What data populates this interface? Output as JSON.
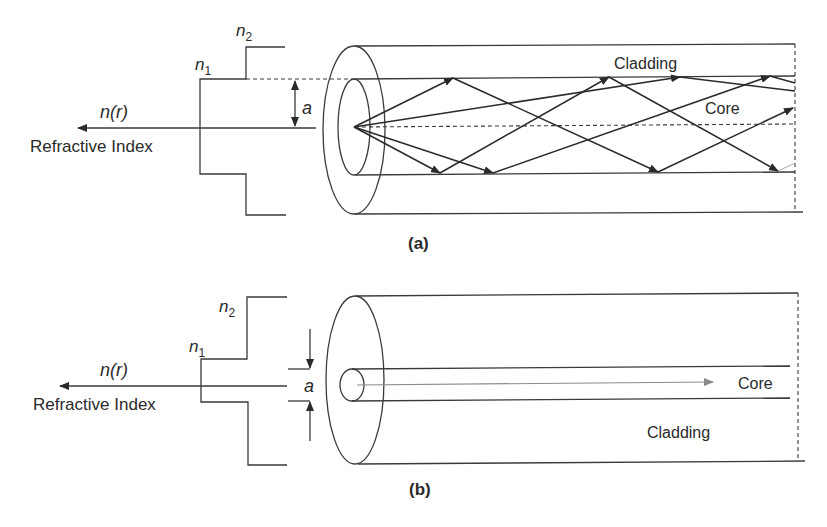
{
  "figure_a": {
    "caption": "(a)",
    "profile_axis_label": "Refractive Index",
    "profile_function": "n(r)",
    "n_outer_label": "n",
    "n_outer_sub": "2",
    "n_inner_label": "n",
    "n_inner_sub": "1",
    "radius_label": "a",
    "cladding_label": "Cladding",
    "core_label": "Core",
    "type": "step-index multimode fiber"
  },
  "figure_b": {
    "caption": "(b)",
    "profile_axis_label": "Refractive Index",
    "profile_function": "n(r)",
    "n_outer_label": "n",
    "n_outer_sub": "2",
    "n_inner_label": "n",
    "n_inner_sub": "1",
    "radius_label": "a",
    "cladding_label": "Cladding",
    "core_label": "Core",
    "type": "step-index single-mode fiber"
  },
  "colors": {
    "line": "#3a3a3a",
    "ray": "#2a2a2a",
    "ray_b": "#8a8a8a",
    "background": "#ffffff"
  }
}
